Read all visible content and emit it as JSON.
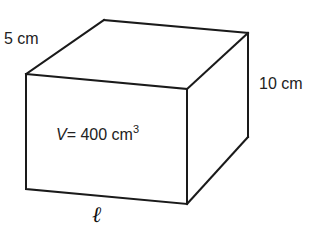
{
  "figure": {
    "shape": "rectangular-prism",
    "labels": {
      "depth": "5 cm",
      "height": "10 cm",
      "volume_var": "V",
      "volume_eq": "= 400 cm",
      "volume_exp": "3",
      "length": "ℓ"
    },
    "values": {
      "depth_cm": 5,
      "height_cm": 10,
      "volume_cm3": 400,
      "length": "unknown"
    }
  }
}
